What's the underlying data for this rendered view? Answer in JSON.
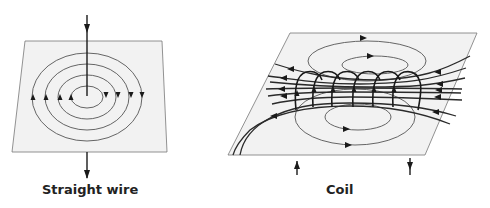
{
  "figure": {
    "panels": [
      {
        "id": "straight-wire",
        "caption": "Straight wire",
        "field_loop_count": 4,
        "current_direction": "downward"
      },
      {
        "id": "coil",
        "caption": "Coil",
        "turn_count": 6,
        "current_direction": "in left lead (up), out right lead (down)"
      }
    ],
    "colors": {
      "line": "#1a1a1a",
      "field": "#555555",
      "plane": "#f2f2f2"
    }
  }
}
